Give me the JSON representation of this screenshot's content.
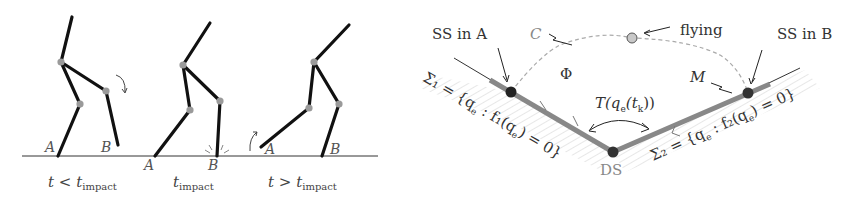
{
  "left_figure": {
    "description": "Biped walker stick figures showing impact sequence",
    "frames": [
      {
        "caption_var": "t",
        "caption_rel": "<",
        "caption_sym": "t",
        "caption_sub": "impact",
        "stance_label": "A",
        "swing_label": "B"
      },
      {
        "caption_var": "",
        "caption_rel": "",
        "caption_sym": "t",
        "caption_sub": "impact",
        "stance_label": "A",
        "swing_label": "B"
      },
      {
        "caption_var": "t",
        "caption_rel": ">",
        "caption_sym": "t",
        "caption_sub": "impact",
        "stance_label": "B",
        "swing_label": "A"
      }
    ],
    "colors": {
      "limb": "#111111",
      "joint": "#9a9a9a",
      "ground": "#333333"
    }
  },
  "right_figure": {
    "labels": {
      "ss_a": "SS in A",
      "ss_b": "SS in B",
      "flying": "flying",
      "c": "C",
      "phi": "Φ",
      "m": "M",
      "transition": "T(q",
      "transition_sub": "e",
      "transition_mid": "(t",
      "transition_sub2": "k",
      "transition_end": "))",
      "ds": "DS",
      "sigma1": "Σ₁ = {q",
      "sigma1_sub": "e",
      "sigma1_mid": " : f₁(q",
      "sigma1_end": ") = 0}",
      "sigma2": "Σ₂ = {q",
      "sigma2_sub": "e",
      "sigma2_mid": " : f₂(q",
      "sigma2_end": ") = 0}"
    },
    "colors": {
      "surface": "#888888",
      "node": "#222222",
      "flying_node": "#c8c8c8",
      "dashed": "#aaaaaa",
      "hatch": "#cccccc"
    }
  }
}
